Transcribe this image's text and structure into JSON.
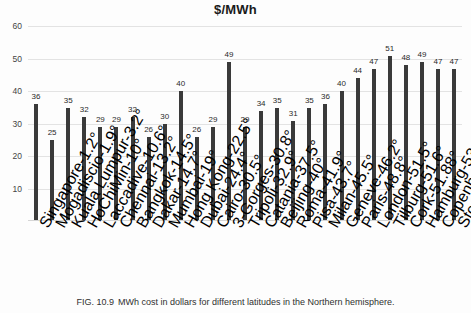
{
  "chart_data": {
    "type": "bar",
    "title": "$/MWh",
    "xlabel": "",
    "ylabel": "",
    "ylim": [
      0,
      62
    ],
    "yticks": [
      10,
      20,
      30,
      40,
      50,
      60
    ],
    "grid": true,
    "legend": "none",
    "bar_color": "#3a3a3a",
    "categories": [
      "Singapore-1.2°",
      "Mogadiscio-1.9°",
      "Kuala Lumpur-3.2°",
      "HoChiMin-10°",
      "Laccadive-10.6°",
      "Chennai-13.2°",
      "Bangkok-14.5°",
      "Dakar-14.7°",
      "Mumbai-19°",
      "Hong Kong-22.5°",
      "Dubai-24.4°",
      "Cairo-30.5°",
      "3-Gorges-30.8°",
      "Tripoli-32.9°",
      "Catania-37.5°",
      "Beijing-40°",
      "Roma-41.9°",
      "Pisa-43.7°",
      "Milan-45.5°",
      "Geneve-46.2°",
      "Paris-48.8°",
      "London-51.5°",
      "Tilburg-51.6°",
      "Cork-51.88°",
      "Hamburg-53.5°",
      "Copenhagen-55.7°",
      "Stockholm-59°"
    ],
    "values": [
      36,
      25,
      35,
      32,
      29,
      29,
      32,
      26,
      30,
      40,
      26,
      29,
      49,
      29,
      34,
      35,
      31,
      35,
      36,
      40,
      44,
      47,
      51,
      48,
      49,
      47,
      47
    ]
  },
  "caption": {
    "figure_number": "FIG. 10.9",
    "text": "MWh cost in dollars for different latitudes in the Northern hemisphere."
  }
}
